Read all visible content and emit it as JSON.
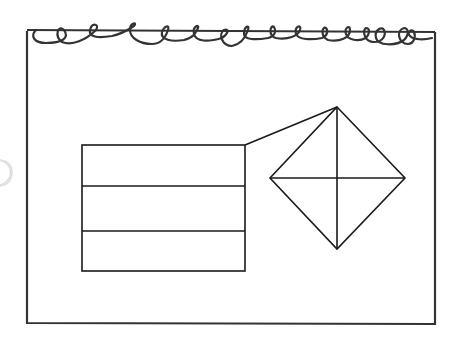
{
  "figure": {
    "colors": {
      "background": "#ffffff",
      "stroke": "#1a1a1a",
      "page_border": "#333333",
      "faint_shape": "#dddddd"
    },
    "notepad": {
      "x": 26,
      "y": 31,
      "width": 409,
      "height": 293
    },
    "spiral_loops": 16,
    "rectangle": {
      "x": 82,
      "y": 145,
      "width": 163,
      "height": 126,
      "bands": 3
    },
    "diamond": {
      "cx": 337,
      "cy": 178,
      "half_width": 68,
      "half_height": 71
    },
    "connector": {
      "from": [
        245,
        145
      ],
      "to": [
        337,
        107
      ]
    }
  }
}
